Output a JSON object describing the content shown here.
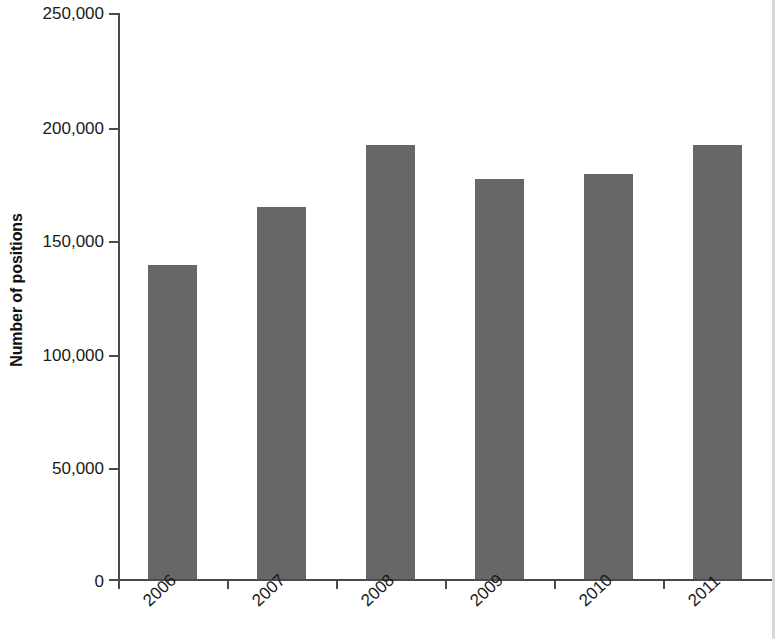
{
  "chart_data": {
    "type": "bar",
    "title": "",
    "subtitle": "",
    "xlabel": "",
    "ylabel": "Number of positions",
    "categories": [
      "2006",
      "2007",
      "2008",
      "2009",
      "2010",
      "2011"
    ],
    "values": [
      138500,
      164200,
      191900,
      176500,
      179100,
      191900
    ],
    "series": [
      {
        "name": "Number of positions",
        "values": [
          138500,
          164200,
          191900,
          176500,
          179100,
          191900
        ]
      }
    ],
    "ylim": [
      0,
      250000
    ],
    "ytick_values": [
      0,
      50000,
      100000,
      150000,
      200000,
      250000
    ],
    "ytick_labels": [
      "0",
      "50,000",
      "100,000",
      "150,000",
      "200,000",
      "250,000"
    ],
    "xtick_labels": [
      "2006",
      "2007",
      "2008",
      "2009",
      "2010",
      "2011"
    ],
    "xtick_rotation": -43,
    "grid": false,
    "legend": false,
    "legend_position": "none",
    "bar_color": "#676767",
    "axis_color": "#4a4a4a",
    "background_color": "#ffffff",
    "annotations": []
  },
  "axes": {
    "y_title": "Number of positions",
    "y_tick_0": "0",
    "y_tick_1": "50,000",
    "y_tick_2": "100,000",
    "y_tick_3": "150,000",
    "y_tick_4": "200,000",
    "y_tick_5": "250,000"
  },
  "x_categories": {
    "c0": "2006",
    "c1": "2007",
    "c2": "2008",
    "c3": "2009",
    "c4": "2010",
    "c5": "2011"
  }
}
